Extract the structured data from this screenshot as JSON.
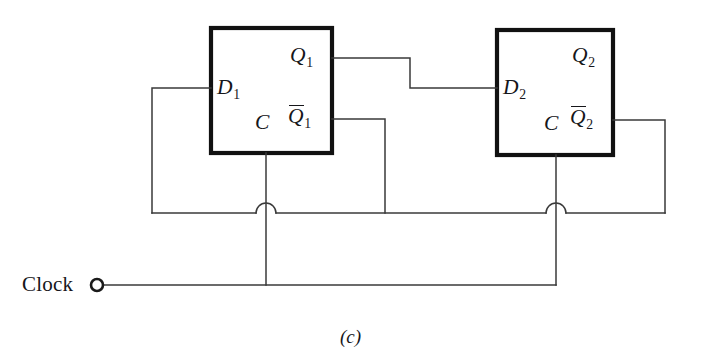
{
  "figure": {
    "caption": "(c)",
    "clock_label": "Clock",
    "background_color": "#ffffff",
    "wire_color": "#3a3a3a",
    "box_border_color": "#111111",
    "text_color": "#16161a"
  },
  "flipflops": [
    {
      "id": "ff1",
      "inputs": {
        "data": "D",
        "data_index": "1",
        "clock": "C"
      },
      "outputs": {
        "q": "Q",
        "q_index": "1",
        "qbar": "Q",
        "qbar_index": "1"
      }
    },
    {
      "id": "ff2",
      "inputs": {
        "data": "D",
        "data_index": "2",
        "clock": "C"
      },
      "outputs": {
        "q": "Q",
        "q_index": "2",
        "qbar": "Q",
        "qbar_index": "2"
      }
    }
  ],
  "connections": [
    {
      "name": "q1-to-d2",
      "from": "Q1",
      "to": "D2"
    },
    {
      "name": "q1bar-to-feedback-bus",
      "from": "Q1bar",
      "to": "feedback-bus"
    },
    {
      "name": "q2bar-to-d1",
      "from": "Q2bar",
      "to": "D1"
    },
    {
      "name": "clock-to-c1",
      "from": "Clock",
      "to": "C1"
    },
    {
      "name": "clock-to-c2",
      "from": "Clock",
      "to": "C2"
    }
  ],
  "crossings": [
    {
      "name": "wire-hop-clock1",
      "x": 266,
      "y": 213
    },
    {
      "name": "wire-hop-clock2",
      "x": 556,
      "y": 213
    }
  ]
}
